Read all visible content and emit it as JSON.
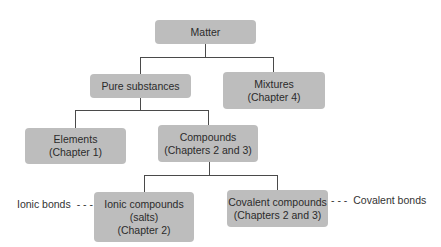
{
  "diagram": {
    "type": "hierarchy",
    "nodes": {
      "matter": {
        "lines": [
          "Matter"
        ]
      },
      "pure_substances": {
        "lines": [
          "Pure substances"
        ]
      },
      "mixtures": {
        "lines": [
          "Mixtures",
          "(Chapter 4)"
        ]
      },
      "elements": {
        "lines": [
          "Elements",
          "(Chapter 1)"
        ]
      },
      "compounds": {
        "lines": [
          "Compounds",
          "(Chapters 2 and 3)"
        ]
      },
      "ionic_compounds": {
        "lines": [
          "Ionic compounds",
          "(salts)",
          "(Chapter 2)"
        ]
      },
      "covalent_compounds": {
        "lines": [
          "Covalent compounds",
          "(Chapters 2 and 3)"
        ]
      }
    },
    "edges": [
      [
        "matter",
        "pure_substances"
      ],
      [
        "matter",
        "mixtures"
      ],
      [
        "pure_substances",
        "elements"
      ],
      [
        "pure_substances",
        "compounds"
      ],
      [
        "compounds",
        "ionic_compounds"
      ],
      [
        "compounds",
        "covalent_compounds"
      ]
    ],
    "annotations": {
      "ionic": {
        "text": "Ionic bonds",
        "dash": "- - -"
      },
      "covalent": {
        "text": "Covalent bonds",
        "dash": "- - -"
      }
    },
    "colors": {
      "box_fill": "#bdbdbd",
      "line": "#4a4a4a",
      "text": "#2b2b2b"
    }
  }
}
